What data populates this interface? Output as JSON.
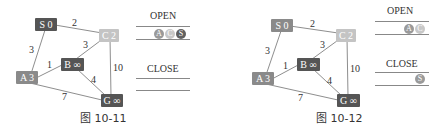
{
  "colors": {
    "node_dark": "#555555",
    "node_mid": "#8a8a8a",
    "node_light": "#c4c4c4",
    "edge": "#8e8e8e"
  },
  "figures": [
    {
      "caption": "图 10-11",
      "nodes": {
        "S": {
          "label": "S 0",
          "shade": "dark"
        },
        "C": {
          "label": "C 2",
          "shade": "light"
        },
        "B": {
          "label": "B ∞",
          "shade": "dark"
        },
        "A": {
          "label": "A 3",
          "shade": "mid"
        },
        "G": {
          "label": "G ∞",
          "shade": "dark"
        }
      },
      "edges": [
        {
          "from": "S",
          "to": "C",
          "weight": "2"
        },
        {
          "from": "S",
          "to": "A",
          "weight": "3"
        },
        {
          "from": "B",
          "to": "C",
          "weight": "3"
        },
        {
          "from": "A",
          "to": "B",
          "weight": "1"
        },
        {
          "from": "C",
          "to": "G",
          "weight": "10"
        },
        {
          "from": "B",
          "to": "G",
          "weight": "4"
        },
        {
          "from": "A",
          "to": "G",
          "weight": "7"
        }
      ],
      "open": {
        "title": "OPEN",
        "items": [
          "A",
          "C",
          "S"
        ]
      },
      "close": {
        "title": "CLOSE",
        "items": []
      }
    },
    {
      "caption": "图 10-12",
      "nodes": {
        "S": {
          "label": "S 0",
          "shade": "mid"
        },
        "C": {
          "label": "C 2",
          "shade": "light"
        },
        "B": {
          "label": "B ∞",
          "shade": "dark"
        },
        "A": {
          "label": "A 3",
          "shade": "mid"
        },
        "G": {
          "label": "G ∞",
          "shade": "dark"
        }
      },
      "edges": [
        {
          "from": "S",
          "to": "C",
          "weight": "2"
        },
        {
          "from": "S",
          "to": "A",
          "weight": "3"
        },
        {
          "from": "B",
          "to": "C",
          "weight": "3"
        },
        {
          "from": "A",
          "to": "B",
          "weight": "1"
        },
        {
          "from": "C",
          "to": "G",
          "weight": "10"
        },
        {
          "from": "B",
          "to": "G",
          "weight": "4"
        },
        {
          "from": "A",
          "to": "G",
          "weight": "7"
        }
      ],
      "open": {
        "title": "OPEN",
        "items": [
          "A",
          "C"
        ]
      },
      "close": {
        "title": "CLOSE",
        "items": [
          "S"
        ]
      }
    }
  ]
}
